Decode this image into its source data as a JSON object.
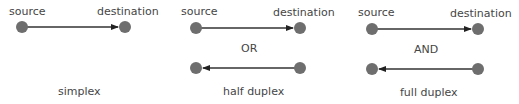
{
  "colors": {
    "node": "#6e6e6e",
    "arrow": "#333333",
    "text": "#454545"
  },
  "panels": [
    {
      "id": "simplex",
      "source_label": "source",
      "destination_label": "destination",
      "caption": "simplex",
      "connector": ""
    },
    {
      "id": "half-duplex",
      "source_label": "source",
      "destination_label": "destination",
      "connector": "OR",
      "caption": "half duplex"
    },
    {
      "id": "full-duplex",
      "source_label": "source",
      "destination_label": "destination",
      "connector": "AND",
      "caption": "full duplex"
    }
  ]
}
